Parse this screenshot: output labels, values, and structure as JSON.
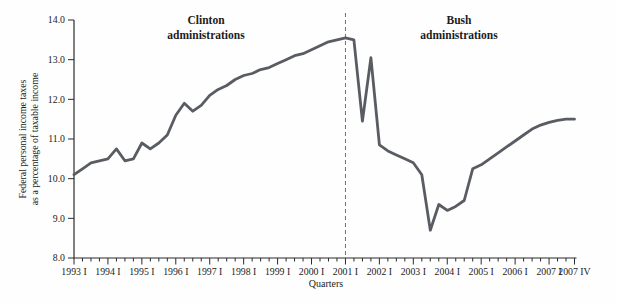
{
  "figure": {
    "background": "#fefefe",
    "annotation_left": {
      "line1": "Clinton",
      "line2": "administrations"
    },
    "annotation_right": {
      "line1": "Bush",
      "line2": "administrations"
    }
  },
  "chart_data": {
    "type": "line",
    "title": "",
    "xlabel": "Quarters",
    "ylabel_line1": "Federal personal income taxes",
    "ylabel_line2": "as a percentage of taxable income",
    "ylim": [
      8.0,
      14.0
    ],
    "grid": "off",
    "legend": "none",
    "axis_color": "#2b2b2b",
    "text_color": "#1c1c1c",
    "line_color": "#595d63",
    "divider_color": "#6f6f6f",
    "y_ticks": [
      "8.0",
      "9.0",
      "10.0",
      "11.0",
      "12.0",
      "13.0",
      "14.0"
    ],
    "x_ticks": [
      {
        "label": "1993 I",
        "q": 0
      },
      {
        "label": "1994 I",
        "q": 4
      },
      {
        "label": "1995 I",
        "q": 8
      },
      {
        "label": "1996 I",
        "q": 12
      },
      {
        "label": "1997 I",
        "q": 16
      },
      {
        "label": "1998 I",
        "q": 20
      },
      {
        "label": "1999 I",
        "q": 24
      },
      {
        "label": "2000 I",
        "q": 28
      },
      {
        "label": "2001 I",
        "q": 32
      },
      {
        "label": "2002 I",
        "q": 36
      },
      {
        "label": "2003 I",
        "q": 40
      },
      {
        "label": "2004 I",
        "q": 44
      },
      {
        "label": "2005 I",
        "q": 48
      },
      {
        "label": "2006 I",
        "q": 52
      },
      {
        "label": "2007 I",
        "q": 56
      },
      {
        "label": "2007 IV",
        "q": 59
      }
    ],
    "divider": {
      "q": 32,
      "at_label": "2001 I",
      "style": "dashed"
    },
    "x_start": "1993 Q1",
    "x_end": "2007 Q4",
    "frequency": "quarterly",
    "series": [
      {
        "name": "Federal personal income taxes as a percentage of taxable income",
        "values": [
          10.1,
          10.25,
          10.4,
          10.45,
          10.5,
          10.75,
          10.45,
          10.5,
          10.9,
          10.75,
          10.9,
          11.1,
          11.6,
          11.9,
          11.7,
          11.85,
          12.1,
          12.25,
          12.35,
          12.5,
          12.6,
          12.65,
          12.75,
          12.8,
          12.9,
          13.0,
          13.1,
          13.15,
          13.25,
          13.35,
          13.45,
          13.5,
          13.55,
          13.5,
          11.45,
          13.05,
          10.85,
          10.7,
          10.6,
          10.5,
          10.4,
          10.1,
          8.7,
          9.35,
          9.2,
          9.3,
          9.45,
          10.25,
          10.35,
          10.5,
          10.65,
          10.8,
          10.95,
          11.1,
          11.25,
          11.35,
          11.42,
          11.47,
          11.5,
          11.5
        ]
      }
    ]
  }
}
